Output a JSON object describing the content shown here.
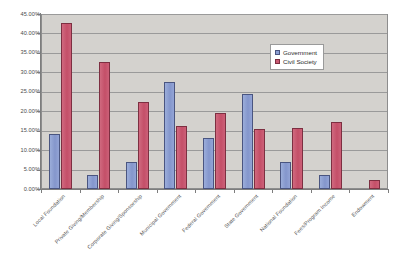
{
  "chart_data": {
    "type": "bar",
    "title": "",
    "subtitle": "",
    "xlabel": "",
    "ylabel": "",
    "ylim": [
      0,
      45
    ],
    "y_tick_labels": [
      "0.00%",
      "5.00%",
      "10.00%",
      "15.00%",
      "20.00%",
      "25.00%",
      "30.00%",
      "35.00%",
      "40.00%",
      "45.00%"
    ],
    "y_tick_values": [
      0,
      5,
      10,
      15,
      20,
      25,
      30,
      35,
      40,
      45
    ],
    "grid": true,
    "legend_position": "upper-right-inside",
    "categories": [
      "Local Foundation",
      "Private Giving/Membership",
      "Corporate Giving/Sponsorship",
      "Municipal Government",
      "Federal Government",
      "State Government",
      "National Foundation",
      "Fees/Program Income",
      "Endowment"
    ],
    "series": [
      {
        "name": "Government",
        "color": "#8c9fd4",
        "values": [
          14.2,
          3.5,
          7.0,
          27.6,
          13.2,
          24.5,
          7.0,
          3.5,
          0.0
        ]
      },
      {
        "name": "Civil Society",
        "color": "#c95a72",
        "values": [
          42.6,
          32.7,
          22.3,
          16.3,
          19.6,
          15.4,
          15.6,
          17.2,
          2.4
        ]
      }
    ]
  },
  "legend": {
    "items": [
      {
        "label": "Government",
        "swatch": "gov"
      },
      {
        "label": "Civil Society",
        "swatch": "civ"
      }
    ]
  }
}
